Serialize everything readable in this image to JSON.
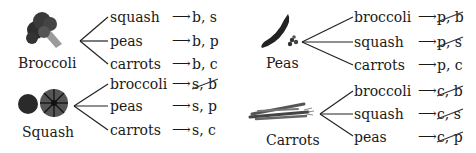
{
  "diagram": {
    "type": "tree-diagram",
    "groups": [
      {
        "first": "Broccoli",
        "icon": "broccoli-icon",
        "branches": [
          {
            "second": "squash",
            "outcome": "b, s",
            "crossed_out": false
          },
          {
            "second": "peas",
            "outcome": "b, p",
            "crossed_out": false
          },
          {
            "second": "carrots",
            "outcome": "b, c",
            "crossed_out": false
          }
        ]
      },
      {
        "first": "Peas",
        "icon": "peas-icon",
        "branches": [
          {
            "second": "broccoli",
            "outcome": "p, b",
            "crossed_out": true
          },
          {
            "second": "squash",
            "outcome": "p, s",
            "crossed_out": true
          },
          {
            "second": "carrots",
            "outcome": "p, c",
            "crossed_out": false
          }
        ]
      },
      {
        "first": "Squash",
        "icon": "squash-icon",
        "branches": [
          {
            "second": "broccoli",
            "outcome": "s, b",
            "crossed_out": true
          },
          {
            "second": "peas",
            "outcome": "s, p",
            "crossed_out": false
          },
          {
            "second": "carrots",
            "outcome": "s, c",
            "crossed_out": false
          }
        ]
      },
      {
        "first": "Carrots",
        "icon": "carrots-icon",
        "branches": [
          {
            "second": "broccoli",
            "outcome": "c, b",
            "crossed_out": true
          },
          {
            "second": "squash",
            "outcome": "c, s",
            "crossed_out": true
          },
          {
            "second": "peas",
            "outcome": "c, p",
            "crossed_out": true
          }
        ]
      }
    ],
    "arrow_glyph": "⟶"
  }
}
